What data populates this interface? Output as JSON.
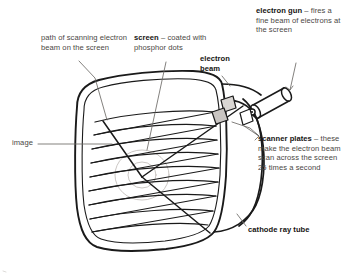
{
  "diagram": {
    "subject": "cathode ray tube",
    "ink_color": "#1a1a1a",
    "text_color": "#4a4744",
    "bold_color": "#161412",
    "faint_color": "#b9b4b0"
  },
  "labels": {
    "path": {
      "name": "path-of-scanning-beam",
      "bold": "",
      "text": "path of scanning electron beam on the screen"
    },
    "screen": {
      "name": "screen",
      "bold": "screen",
      "text": " – coated with phosphor dots"
    },
    "beam": {
      "name": "electron-beam",
      "bold": "electron beam",
      "text": ""
    },
    "gun": {
      "name": "electron-gun",
      "bold": "electron gun",
      "text": " – fires a fine beam of electrons at the screen"
    },
    "scanner": {
      "name": "scanner-plates",
      "bold": "scanner plates",
      "text": " – these make the electron beam scan across the screen 25 times a second"
    },
    "crt": {
      "name": "cathode-ray-tube",
      "bold": "cathode ray tube",
      "text": ""
    },
    "image": {
      "name": "image",
      "bold": "",
      "text": "image"
    }
  },
  "parts": [
    {
      "key": "screen-face",
      "label": "screen face with phosphor dots"
    },
    {
      "key": "raster-lines",
      "label": "scanning raster lines"
    },
    {
      "key": "image-circle",
      "label": "image on screen"
    },
    {
      "key": "tube-body",
      "label": "cathode ray tube body"
    },
    {
      "key": "electron-gun-cylinder",
      "label": "electron gun"
    },
    {
      "key": "scanner-plate-upper",
      "label": "upper scanner plate"
    },
    {
      "key": "scanner-plate-lower",
      "label": "lower scanner plate"
    },
    {
      "key": "beam-line",
      "label": "electron beam path"
    }
  ]
}
